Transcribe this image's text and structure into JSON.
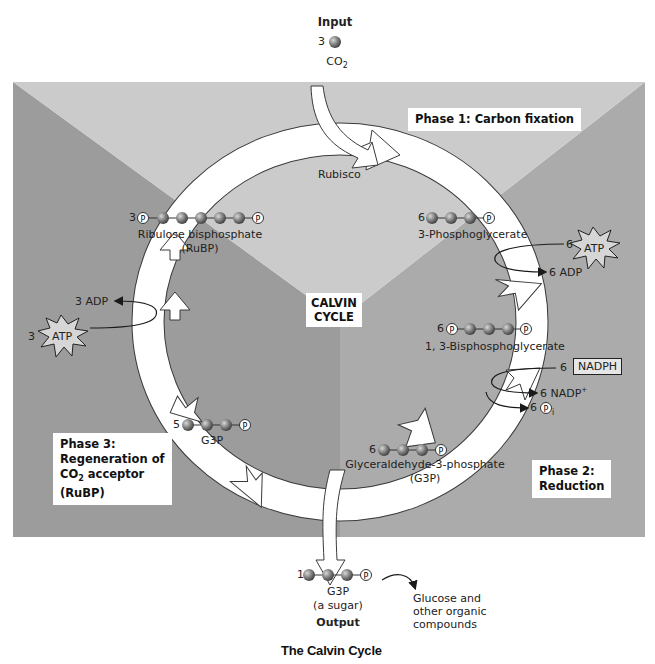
{
  "title": "The Calvin Cycle",
  "center_label": [
    "CALVIN",
    "CYCLE"
  ],
  "input": {
    "heading": "Input",
    "count": "3",
    "molecule": "CO",
    "subscript": "2"
  },
  "output": {
    "heading": "Output",
    "count": "1",
    "name": "G3P",
    "note": "(a sugar)",
    "products": [
      "Glucose and",
      "other organic",
      "compounds"
    ]
  },
  "enzyme": "Rubisco",
  "phases": {
    "phase1": "Phase 1: Carbon fixation",
    "phase2": [
      "Phase 2:",
      "Reduction"
    ],
    "phase3": [
      "Phase 3:",
      "Regeneration of",
      "CO",
      "2",
      " acceptor",
      "(RuBP)"
    ]
  },
  "molecules": {
    "rubp": {
      "count": "3",
      "name": "Ribulose bisphosphate",
      "abbr": "(RuBP)"
    },
    "pga": {
      "count": "6",
      "name": "3-Phosphoglycerate"
    },
    "bpg": {
      "count": "6",
      "name": "1, 3-Bisphosphoglycerate"
    },
    "g3p": {
      "count": "6",
      "name": "Glyceraldehyde-3-phosphate",
      "abbr": "(G3P)"
    },
    "g3p5": {
      "count": "5",
      "name": "G3P"
    }
  },
  "energy": {
    "atp_in_reduction": {
      "count": "6",
      "label": "ATP"
    },
    "adp_out_reduction": "6 ADP",
    "nadph_in": {
      "count": "6",
      "label": "NADPH"
    },
    "nadp_out": "6 NADP",
    "nadp_sup": "+",
    "pi_out": {
      "count": "6",
      "symbol": "P",
      "sub": "i"
    },
    "atp_in_regen": {
      "count": "3",
      "label": "ATP"
    },
    "adp_out_regen": "3 ADP"
  },
  "phosphate_symbol": "P",
  "colors": {
    "phase1_bg": "#c9c9c9",
    "phase2_bg": "#a9a9a9",
    "phase3_bg": "#9a9a9a",
    "ring": "#ffffff",
    "ring_stroke": "#3a3a3a",
    "carbon_ball": "#7a7a7a"
  }
}
